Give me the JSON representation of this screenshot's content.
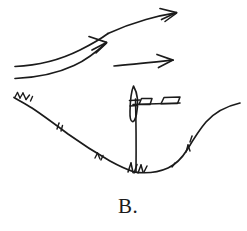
{
  "figure": {
    "label": "B.",
    "background_color": "#ffffff",
    "ink_color": "#1b1b1b",
    "style": "hand-drawn pen sketch",
    "width": 247,
    "height": 231
  },
  "caption": {
    "text": "B.",
    "x": 118,
    "y": 212
  },
  "wind_arrows": [
    {
      "name": "upper-curved-wind-arrow",
      "description": "long curved arrow rising from lower-left to upper-right",
      "start": [
        15,
        66
      ],
      "end": [
        176,
        13
      ],
      "curved": true
    },
    {
      "name": "middle-curved-wind-arrow",
      "description": "curved arrow from left edge rising to a head at mid-height",
      "start": [
        15,
        78
      ],
      "end": [
        106,
        42
      ],
      "curved": true
    },
    {
      "name": "lower-straight-wind-arrow",
      "description": "short straight horizontal arrow at mid-right",
      "start": [
        114,
        66
      ],
      "end": [
        173,
        60
      ],
      "curved": false
    }
  ],
  "terrain": {
    "name": "valley-profile",
    "description": "V-shaped valley cross-section with grass tick marks",
    "left_ridge": [
      14,
      97
    ],
    "valley_bottom": [
      135,
      172
    ],
    "right_ridge": [
      240,
      103
    ],
    "grass_tick_count": 9
  },
  "turbine": {
    "name": "wind-turbine",
    "description": "wind turbine on the valley floor with vertical rotor blade and horizontal boom",
    "tower_base": [
      136,
      172
    ],
    "tower_top": [
      136,
      100
    ],
    "rotor_center": [
      133,
      103
    ],
    "boom_start": [
      131,
      100
    ],
    "boom_end": [
      180,
      98
    ],
    "parts": [
      {
        "name": "rotor-blade",
        "shape": "elongated vertical lens"
      },
      {
        "name": "nacelle-box",
        "shape": "small parallelogram"
      },
      {
        "name": "tail-vane-box",
        "shape": "small parallelogram"
      },
      {
        "name": "tower-mast",
        "shape": "vertical line"
      }
    ]
  }
}
